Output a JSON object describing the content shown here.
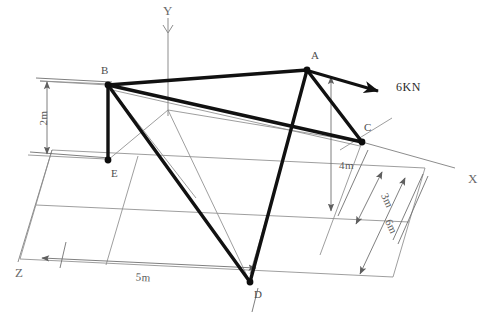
{
  "figure": {
    "kind": "space-frame-free-body-diagram",
    "background_color": "#ffffff",
    "member_color": "#111111",
    "construction_color": "#8d8d8d",
    "dimension_color": "#707070"
  },
  "axes": [
    {
      "id": "y",
      "label": "Y"
    },
    {
      "id": "x",
      "label": "X"
    },
    {
      "id": "z",
      "label": "Z"
    }
  ],
  "nodes": [
    {
      "id": "A",
      "label": "A",
      "x": 307,
      "y": 70,
      "label_x": 311,
      "label_y": 59
    },
    {
      "id": "B",
      "label": "B",
      "x": 108,
      "y": 85,
      "label_x": 104,
      "label_y": 74
    },
    {
      "id": "C",
      "label": "C",
      "x": 362,
      "y": 142,
      "label_x": 364,
      "label_y": 131
    },
    {
      "id": "D",
      "label": "D",
      "x": 250,
      "y": 282,
      "label_x": 254,
      "label_y": 296
    },
    {
      "id": "E",
      "label": "E",
      "x": 108,
      "y": 160,
      "label_x": 111,
      "label_y": 176
    }
  ],
  "members": [
    {
      "id": "BA",
      "from": "B",
      "to": "A"
    },
    {
      "id": "AC",
      "from": "A",
      "to": "C"
    },
    {
      "id": "BC",
      "from": "B",
      "to": "C"
    },
    {
      "id": "BE",
      "from": "B",
      "to": "E"
    },
    {
      "id": "BD",
      "from": "B",
      "to": "D"
    },
    {
      "id": "AD",
      "from": "A",
      "to": "D"
    }
  ],
  "load": {
    "label": "6KN",
    "magnitude": 6,
    "unit": "KN",
    "applied_at": "A",
    "direction": "horizontal-right",
    "label_x": 396,
    "label_y": 91
  },
  "dimensions": [
    {
      "id": "height-2m",
      "label": "2m",
      "value": 2,
      "unit": "m",
      "orientation": "vertical",
      "describes": "B to E height"
    },
    {
      "id": "height-4m",
      "label": "4m",
      "value": 4,
      "unit": "m",
      "orientation": "vertical",
      "describes": "A to ground height"
    },
    {
      "id": "depth-3m",
      "label": "3m",
      "value": 3,
      "unit": "m",
      "orientation": "oblique",
      "describes": "C offset along Z"
    },
    {
      "id": "depth-6m",
      "label": "6m",
      "value": 6,
      "unit": "m",
      "orientation": "oblique",
      "describes": "full depth along Z"
    },
    {
      "id": "width-5m",
      "label": "5m",
      "value": 5,
      "unit": "m",
      "orientation": "oblique",
      "describes": "span along X to D"
    }
  ]
}
